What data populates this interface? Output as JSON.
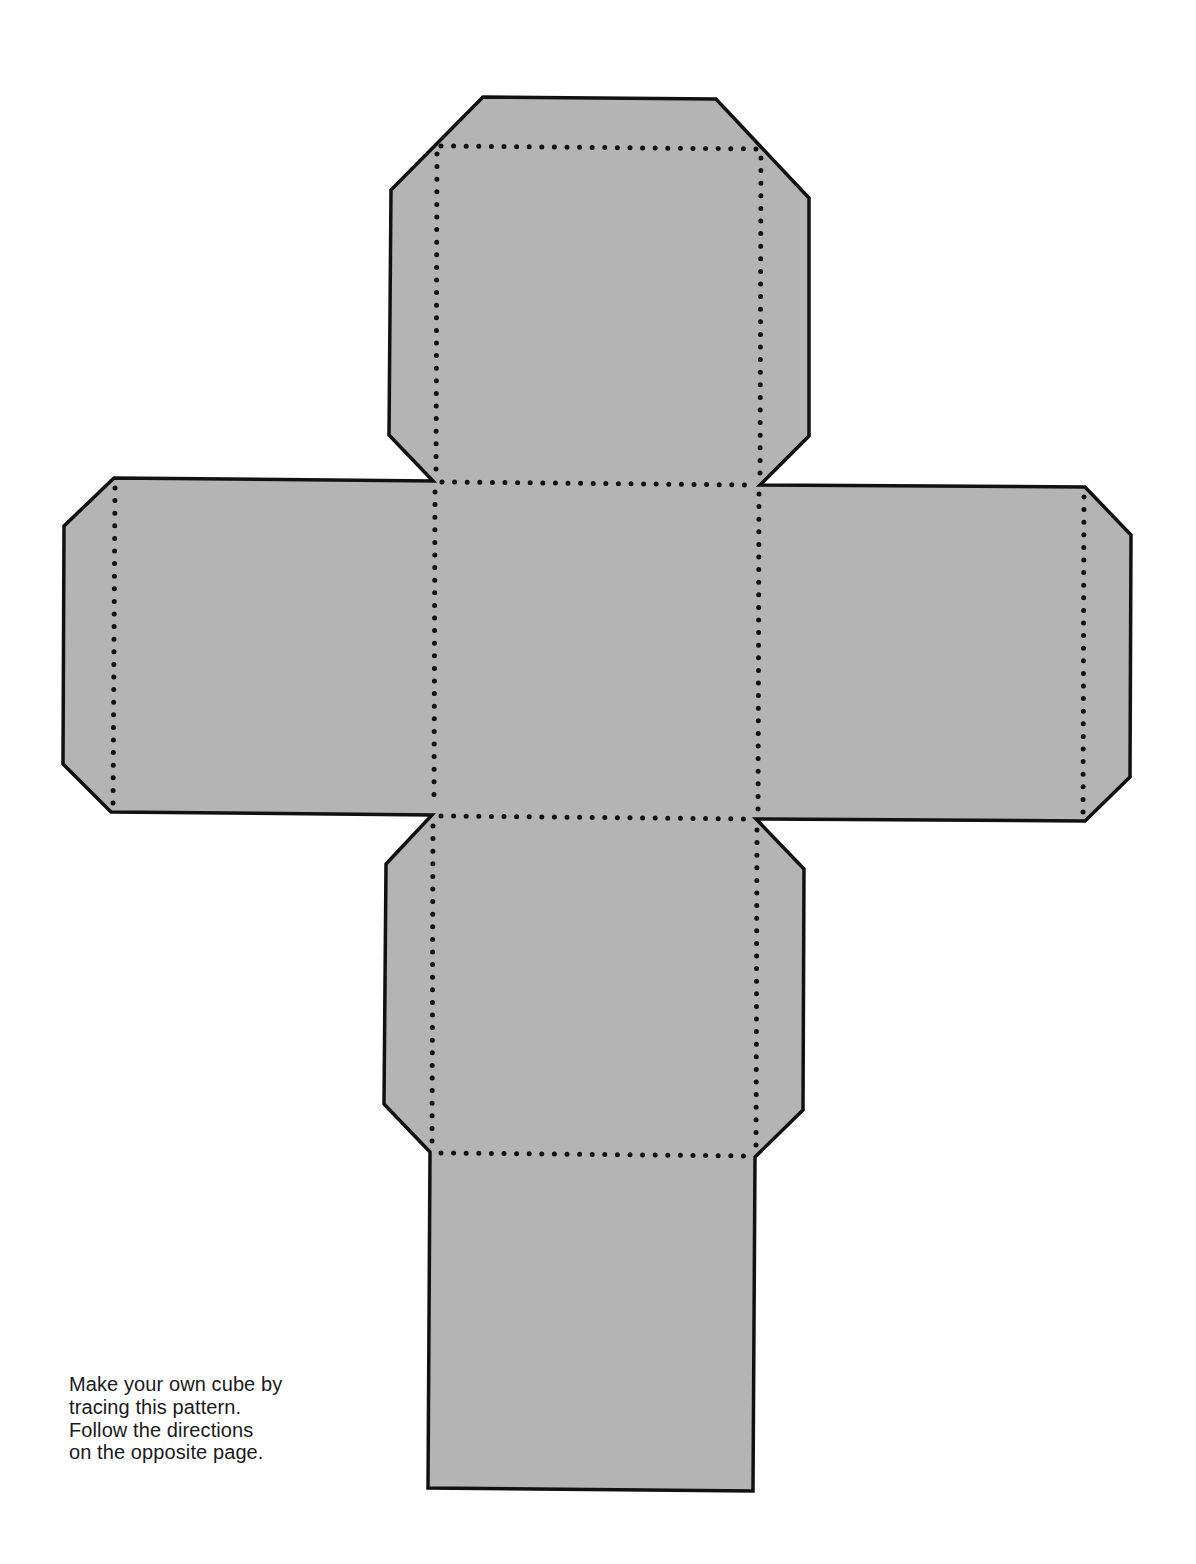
{
  "diagram": {
    "type": "cube-net",
    "fill_color": "#b4b4b4",
    "outline_color": "#111111",
    "fold_line_style": "dotted",
    "faces": [
      "top",
      "left",
      "center",
      "right",
      "bottom"
    ],
    "flaps": [
      "top-tab",
      "left-tab",
      "right-tab",
      "bottom-flap"
    ]
  },
  "caption": {
    "lines": [
      "Make your own cube by",
      "tracing this pattern.",
      "Follow the directions",
      "on the opposite page."
    ]
  }
}
